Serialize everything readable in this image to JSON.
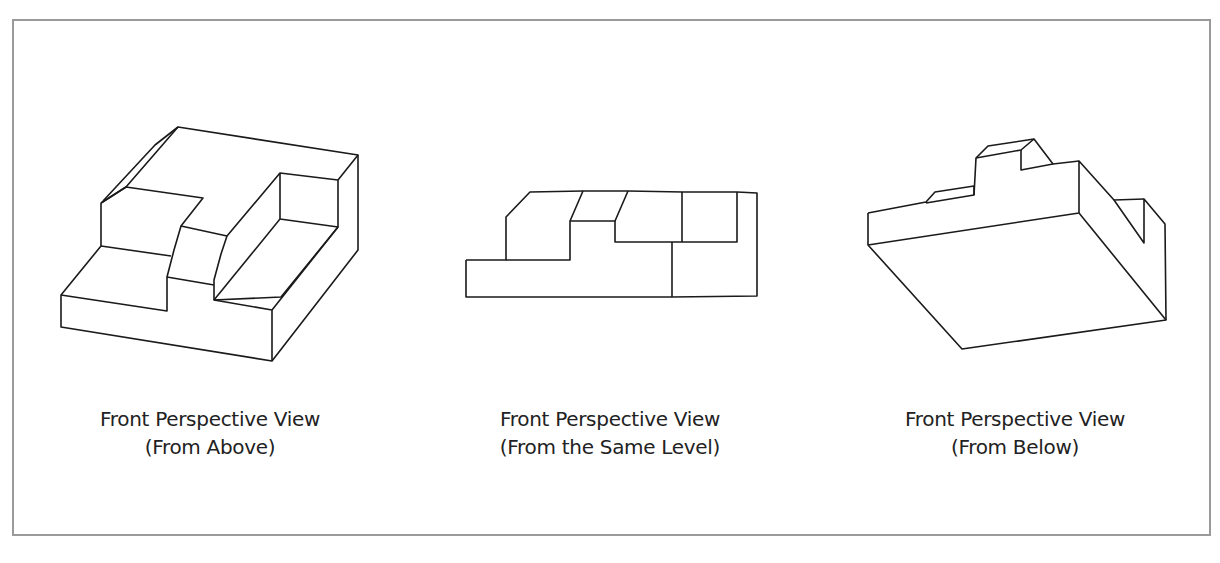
{
  "figure": {
    "views": [
      {
        "id": "from-above",
        "title": "Front Perspective View",
        "subtitle": "(From Above)",
        "lines": [
          "101,203 126,187 178,127 358,155 358,250 272,361 61,327 61,295 101,246 101,203",
          "101,203 126,187 203,198 181,226 174,250 167,277 167,311 61,295",
          "101,246 171,256",
          "178,127 155,145 103,201",
          "181,226 227,236 280,173 338,180 338,227 281,297 214,300 214,280 221,254 227,236",
          "167,277 214,285",
          "280,173 280,219 338,227",
          "280,219 214,300",
          "272,361 272,310 214,300",
          "272,310 338,227",
          "338,180 358,155"
        ]
      },
      {
        "id": "same-level",
        "title": "Front Perspective View",
        "subtitle": "(From the Same Level)",
        "lines": [
          "466,260 466,297 672,297 757,296 757,193 737,192 683,192 628,191 583,191 530,192 506,217 506,260 466,260",
          "506,260 570,260 570,221 583,191",
          "570,221 615,221 628,191",
          "615,221 615,242 682,242 737,242 737,192",
          "682,242 682,192",
          "672,242 672,297"
        ]
      },
      {
        "id": "from-below",
        "title": "Front Perspective View",
        "subtitle": "(From Below)",
        "lines": [
          "868,213 868,245 962,349 1166,320 1165,224 1144,199 1144,243 1114,200 1079,161 1079,213 868,245",
          "868,213 926,202 935,192 974,186 974,195 926,203",
          "974,195 976,158 988,146 1034,139 1053,164 1079,161",
          "976,158 1021,150 1034,139",
          "1021,150 1021,170 1053,164",
          "1079,213 1166,320",
          "1144,199 1114,200"
        ]
      }
    ],
    "caption_partial": "",
    "line_color": "#1a1a1a",
    "frame_color": "#9a9a9a"
  }
}
